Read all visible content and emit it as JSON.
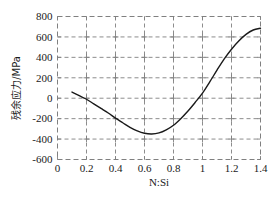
{
  "chart_data": {
    "type": "line",
    "title": "",
    "subtitle": "",
    "xlabel": "N:Si",
    "ylabel": "残余应力/MPa",
    "xlim": [
      0,
      1.4
    ],
    "ylim": [
      -600,
      800
    ],
    "grid": true,
    "legend": null,
    "legend_position": "none",
    "x_ticks": [
      0,
      0.2,
      0.4,
      0.6,
      0.8,
      1,
      1.2,
      1.4
    ],
    "x_tick_labels": [
      "0",
      "0.2",
      "0.4",
      "0.6",
      "0.8",
      "1",
      "1.2",
      "1.4"
    ],
    "y_ticks": [
      -600,
      -400,
      -200,
      0,
      200,
      400,
      600,
      800
    ],
    "y_tick_labels": [
      "-600",
      "-400",
      "-200",
      "0",
      "200",
      "400",
      "600",
      "800"
    ],
    "series": [
      {
        "name": "残余应力",
        "color": "#1a1a1a",
        "line_width": 1.4,
        "x": [
          0.1,
          0.15,
          0.2,
          0.25,
          0.3,
          0.35,
          0.4,
          0.45,
          0.5,
          0.55,
          0.6,
          0.65,
          0.7,
          0.75,
          0.8,
          0.85,
          0.9,
          0.95,
          1.0,
          1.05,
          1.1,
          1.15,
          1.2,
          1.25,
          1.3,
          1.35,
          1.4
        ],
        "y": [
          60,
          25,
          -10,
          -55,
          -100,
          -145,
          -195,
          -240,
          -285,
          -320,
          -343,
          -350,
          -340,
          -310,
          -265,
          -200,
          -125,
          -40,
          50,
          160,
          275,
          385,
          480,
          560,
          625,
          668,
          685
        ]
      }
    ],
    "annotations": []
  },
  "figure": {
    "background_color": "#ffffff",
    "plot_background_color": "#ffffff",
    "grid_color": "#808080",
    "grid_style": "dashed",
    "axis_color": "#808080",
    "text_color": "#1a1a1a"
  }
}
